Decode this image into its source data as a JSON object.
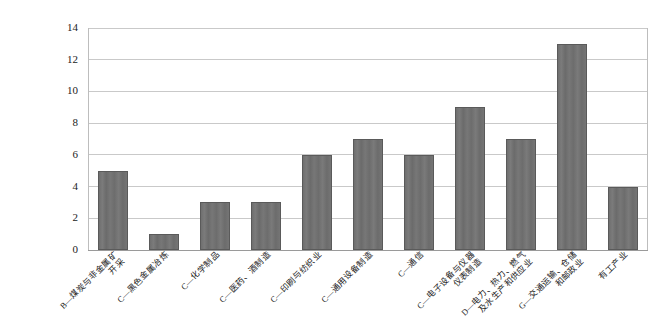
{
  "chart_data": {
    "type": "bar",
    "title": "",
    "subtitle": "",
    "xlabel": "",
    "ylabel": "",
    "ylim": [
      0,
      14
    ],
    "yticks": [
      "0",
      "2",
      "4",
      "6",
      "8",
      "10",
      "12",
      "14"
    ],
    "grid": true,
    "legend": false,
    "legend_position": "none",
    "bar_color": "#6f6f6f",
    "bar_edge_color": "#5a5a5a",
    "gridline_color": "#c9c9c9",
    "axis_color": "#9a9a9a",
    "categories": [
      "B—煤炭与非金属矿\n开采",
      "C—黑色金属冶炼",
      "C—化学制品",
      "C—医药、酒制造",
      "C—印刷与纺织业",
      "C—通用设备制造",
      "C—通信",
      "C—电子设备与仪器\n仪表制造",
      "D—电力、热力、燃气\n及水生产和供应业",
      "G—交通运输、仓储\n和邮政业",
      "有工产业"
    ],
    "values": [
      5,
      1,
      3,
      3,
      6,
      7,
      6,
      9,
      7,
      13,
      4
    ]
  }
}
